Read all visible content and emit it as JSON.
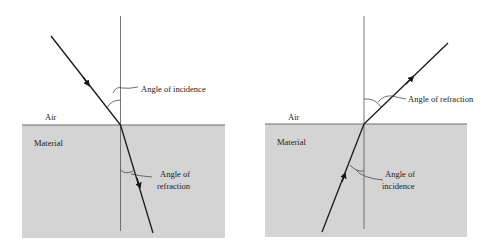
{
  "colors": {
    "material_fill": "#d4d4d4",
    "line": "#1a1a1a",
    "normal": "#555555",
    "surface": "#6a6a6a"
  },
  "diagrams": [
    {
      "name": "air-to-material",
      "medium_top_label": "Air",
      "medium_bottom_label": "Material",
      "upper_angle_label": "Angle of incidence",
      "lower_angle_label_line1": "Angle of",
      "lower_angle_label_line2": "refraction"
    },
    {
      "name": "material-to-air",
      "medium_top_label": "Air",
      "medium_bottom_label": "Material",
      "upper_angle_label": "Angle of refraction",
      "lower_angle_label_line1": "Angle of",
      "lower_angle_label_line2": "incidence"
    }
  ]
}
